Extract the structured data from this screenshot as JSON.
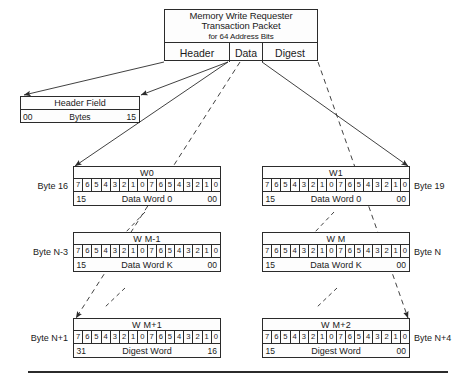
{
  "packet": {
    "title_line1": "Memory Write Requester",
    "title_line2": "Transaction Packet",
    "title_line3": "for 64 Address Bits",
    "sections": [
      {
        "label": "Header"
      },
      {
        "label": "Data"
      },
      {
        "label": "Digest"
      }
    ]
  },
  "header_field": {
    "title": "Header Field",
    "low": "00",
    "middle": "Bytes",
    "high": "15"
  },
  "bit_labels": [
    "7",
    "6",
    "5",
    "4",
    "3",
    "2",
    "1",
    "0",
    "7",
    "6",
    "5",
    "4",
    "3",
    "2",
    "1",
    "0"
  ],
  "words": [
    {
      "name": "W0",
      "byte_label": "Byte 16",
      "byte_side": "left",
      "low": "15",
      "middle": "Data Word 0",
      "high": "00"
    },
    {
      "name": "W1",
      "byte_label": "Byte 19",
      "byte_side": "right",
      "low": "15",
      "middle": "Data Word 0",
      "high": "00"
    },
    {
      "name": "W M-1",
      "byte_label": "Byte N-3",
      "byte_side": "left",
      "low": "15",
      "middle": "Data Word K",
      "high": "00"
    },
    {
      "name": "W M",
      "byte_label": "Byte N",
      "byte_side": "right",
      "low": "15",
      "middle": "Data Word K",
      "high": "00"
    },
    {
      "name": "W M+1",
      "byte_label": "Byte N+1",
      "byte_side": "left",
      "low": "31",
      "middle": "Digest Word",
      "high": "16"
    },
    {
      "name": "W M+2",
      "byte_label": "Byte N+4",
      "byte_side": "right",
      "low": "15",
      "middle": "Digest Word",
      "high": "00"
    }
  ],
  "colors": {
    "line": "#2b2b2b",
    "fill": "#fdfdfd",
    "text": "#1a1a1a"
  }
}
